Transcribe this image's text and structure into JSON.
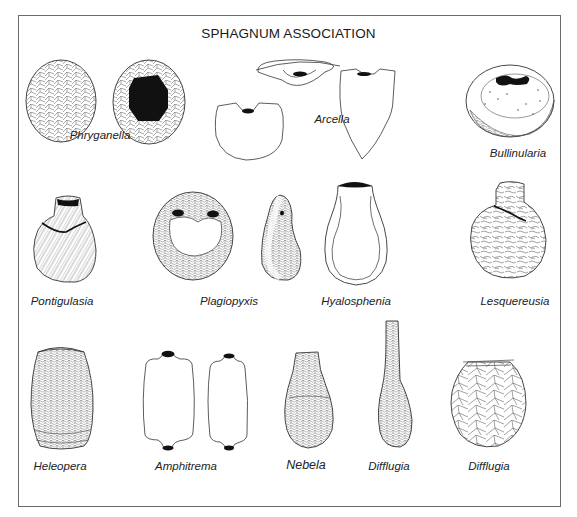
{
  "figure": {
    "title": "SPHAGNUM ASSOCIATION",
    "colors": {
      "line": "#3a3a3a",
      "fill": "#111111",
      "frame": "#6b6b6b",
      "background": "#ffffff"
    },
    "labels": [
      {
        "id": "phryganella",
        "text": "Phryganella",
        "x": 100,
        "y": 137
      },
      {
        "id": "arcella",
        "text": "Arcella",
        "x": 332,
        "y": 115
      },
      {
        "id": "bullinularia",
        "text": "Bullinularia",
        "x": 518,
        "y": 148
      },
      {
        "id": "pontigulasia",
        "text": "Pontigulasia",
        "x": 62,
        "y": 296
      },
      {
        "id": "plagiopyxis",
        "text": "Plagiopyxis",
        "x": 229,
        "y": 296
      },
      {
        "id": "hyalosphenia",
        "text": "Hyalosphenia",
        "x": 356,
        "y": 296
      },
      {
        "id": "lesquereusia",
        "text": "Lesquereusia",
        "x": 515,
        "y": 296
      },
      {
        "id": "heleopera",
        "text": "Heleopera",
        "x": 60,
        "y": 461
      },
      {
        "id": "amphitrema",
        "text": "Amphitrema",
        "x": 186,
        "y": 461
      },
      {
        "id": "nebela",
        "text": "Nebela",
        "x": 306,
        "y": 459
      },
      {
        "id": "difflugia-1",
        "text": "Difflugia",
        "x": 389,
        "y": 461
      },
      {
        "id": "difflugia-2",
        "text": "Difflugia",
        "x": 489,
        "y": 461
      }
    ]
  }
}
